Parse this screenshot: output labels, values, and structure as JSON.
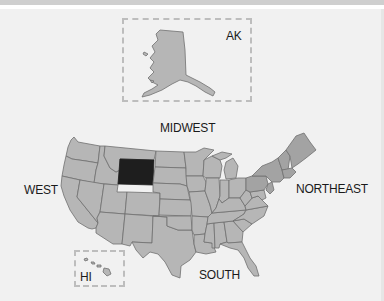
{
  "map": {
    "title": "United States regions map",
    "highlighted_state": "Wyoming",
    "colors": {
      "background": "#f1f1f1",
      "state_fill": "#b6b6b6",
      "northeast_fill": "#a3a3a3",
      "highlight_fill": "#1e1e1e",
      "border": "#707070",
      "inset_border": "#bdbdbd"
    },
    "regions": {
      "west": "WEST",
      "midwest": "MIDWEST",
      "northeast": "NORTHEAST",
      "south": "SOUTH"
    },
    "insets": {
      "alaska": "AK",
      "hawaii": "HI"
    }
  }
}
